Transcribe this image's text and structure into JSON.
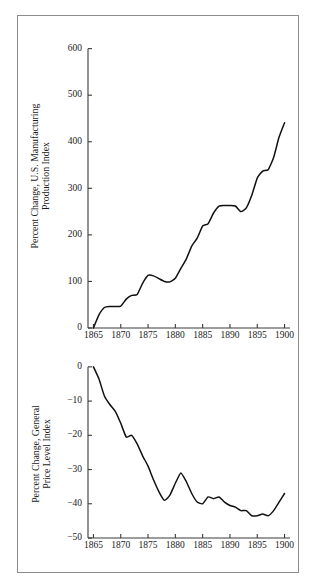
{
  "figure": {
    "background_color": "#ffffff",
    "frame_color": "#8d8d8d",
    "line_color": "#111111",
    "axis_color": "#3a3a3a"
  },
  "chart_data": [
    {
      "id": "manufacturing-production",
      "type": "line",
      "title": "",
      "xlabel": "",
      "ylabel": "Percent Change, U.S. Manufacturing Production Index",
      "ylabel_line1": "Percent Change, U.S. Manufacturing",
      "ylabel_line2": "Production Index",
      "xlim": [
        1864,
        1901
      ],
      "ylim": [
        0,
        640
      ],
      "yticks": [
        0,
        100,
        200,
        300,
        400,
        500,
        600
      ],
      "ytick_labels": [
        "0",
        "100",
        "200",
        "300",
        "400",
        "500",
        "600"
      ],
      "xticks": [
        1865,
        1870,
        1875,
        1880,
        1885,
        1890,
        1895,
        1900
      ],
      "xtick_labels": [
        "1865",
        "1870",
        "1875",
        "1880",
        "1885",
        "1890",
        "1895",
        "1900"
      ],
      "grid": false,
      "legend": "none",
      "x": [
        1865,
        1866,
        1867,
        1868,
        1869,
        1870,
        1871,
        1872,
        1873,
        1874,
        1875,
        1876,
        1877,
        1878,
        1879,
        1880,
        1881,
        1882,
        1883,
        1884,
        1885,
        1886,
        1887,
        1888,
        1889,
        1890,
        1891,
        1892,
        1893,
        1894,
        1895,
        1896,
        1897,
        1898,
        1899,
        1900
      ],
      "values": [
        0,
        28,
        44,
        46,
        46,
        47,
        62,
        70,
        72,
        96,
        113,
        112,
        106,
        100,
        99,
        107,
        128,
        148,
        176,
        193,
        219,
        224,
        247,
        262,
        263,
        263,
        262,
        250,
        258,
        285,
        322,
        337,
        340,
        366,
        410,
        441
      ]
    },
    {
      "id": "manufacturing-production-tail",
      "type": "line-continuation",
      "x": [
        1890,
        1891,
        1892,
        1893,
        1894,
        1895,
        1896,
        1897,
        1898,
        1899,
        1900
      ],
      "values": [
        437,
        470,
        472,
        430,
        397,
        396,
        460,
        501,
        459,
        540,
        615
      ]
    },
    {
      "id": "general-price-level",
      "type": "line",
      "title": "",
      "xlabel": "",
      "ylabel": "Percent Change, General Price Level Index",
      "ylabel_line1": "Percent Change, General",
      "ylabel_line2": "Price Level Index",
      "xlim": [
        1864,
        1901
      ],
      "ylim": [
        -50,
        2
      ],
      "yticks": [
        0,
        -10,
        -20,
        -30,
        -40,
        -50
      ],
      "ytick_labels": [
        "0",
        "−10",
        "−20",
        "−30",
        "−40",
        "−50"
      ],
      "xticks": [
        1865,
        1870,
        1875,
        1880,
        1885,
        1890,
        1895,
        1900
      ],
      "xtick_labels": [
        "1865",
        "1870",
        "1875",
        "1880",
        "1885",
        "1890",
        "1895",
        "1900"
      ],
      "grid": false,
      "legend": "none",
      "x": [
        1865,
        1866,
        1867,
        1868,
        1869,
        1870,
        1871,
        1872,
        1873,
        1874,
        1875,
        1876,
        1877,
        1878,
        1879,
        1880,
        1881,
        1882,
        1883,
        1884,
        1885,
        1886,
        1887,
        1888,
        1889,
        1890,
        1891,
        1892,
        1893,
        1894,
        1895,
        1896,
        1897,
        1898,
        1899,
        1900
      ],
      "values": [
        0,
        -3.5,
        -8.5,
        -11.0,
        -13.0,
        -16.5,
        -20.5,
        -20.0,
        -22.5,
        -26.0,
        -29.0,
        -33.0,
        -36.5,
        -39.0,
        -37.5,
        -34.0,
        -31.0,
        -33.5,
        -37.0,
        -39.5,
        -40.0,
        -38.0,
        -38.5,
        -38.0,
        -39.5,
        -40.5,
        -41.0,
        -42.0,
        -42.0,
        -43.5,
        -43.5,
        -43.0,
        -43.5,
        -42.0,
        -39.5,
        -37.0
      ]
    }
  ]
}
